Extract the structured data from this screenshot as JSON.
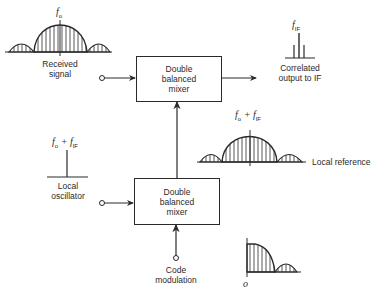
{
  "diagram": {
    "top_mixer": {
      "line1": "Double",
      "line2": "balanced",
      "line3": "mixer"
    },
    "bottom_mixer": {
      "line1": "Double",
      "line2": "balanced",
      "line3": "mixer"
    },
    "received_signal": {
      "line1": "Received",
      "line2": "signal",
      "freq_main": "f",
      "freq_sub": "o"
    },
    "output": {
      "line1": "Correlated",
      "line2": "output to IF",
      "freq_main": "f",
      "freq_sub": "IF"
    },
    "local_reference": {
      "label": "Local reference",
      "freq_a": "f",
      "freq_a_sub": "o",
      "plus": " + ",
      "freq_b": "f",
      "freq_b_sub": "IF"
    },
    "local_oscillator": {
      "line1": "Local",
      "line2": "oscillator",
      "freq_a": "f",
      "freq_a_sub": "o",
      "plus": " + ",
      "freq_b": "f",
      "freq_b_sub": "IF"
    },
    "code_modulation": {
      "line1": "Code",
      "line2": "modulation",
      "origin_label": "o"
    }
  },
  "colors": {
    "line": "#2a2a2a",
    "background": "#ffffff"
  }
}
